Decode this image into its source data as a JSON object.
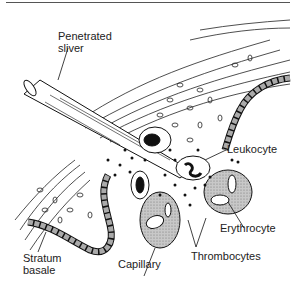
{
  "figure": {
    "labels": {
      "sliver_line1": "Penetrated",
      "sliver_line2": "sliver",
      "leukocyte": "Leukocyte",
      "erythrocyte": "Erythrocyte",
      "thrombocytes": "Thrombocytes",
      "capillary": "Capillary",
      "stratum_line1": "Stratum",
      "stratum_line2": "basale"
    },
    "colors": {
      "ink": "#111111",
      "cell_fill": "#aaaaaa",
      "blood_fill": "#bbbbbb",
      "background": "#ffffff"
    }
  }
}
